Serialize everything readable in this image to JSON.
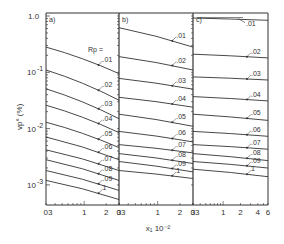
{
  "chart_data": {
    "type": "line",
    "title": "",
    "xlabel": "x1 10^-2",
    "ylabel": "vp° (%)",
    "yscale": "log",
    "xscale": "log",
    "ylim": [
      0.001,
      1.0
    ],
    "y_tick_labels": [
      "1.0",
      "10-1",
      "10-2",
      "10-3"
    ],
    "legend_title": "Rp =",
    "grid": false,
    "panels": [
      {
        "label": "a)",
        "xlim": [
          0.3,
          3
        ],
        "x_tick_labels": [
          "0.3",
          "1",
          "2",
          "3"
        ],
        "series": [
          {
            "name": ".01",
            "x": [
              0.3,
              3
            ],
            "values": [
              0.28,
              0.095
            ]
          },
          {
            "name": ".02",
            "x": [
              0.3,
              3
            ],
            "values": [
              0.11,
              0.032
            ]
          },
          {
            "name": ".03",
            "x": [
              0.3,
              3
            ],
            "values": [
              0.051,
              0.015
            ]
          },
          {
            "name": ".04",
            "x": [
              0.3,
              3
            ],
            "values": [
              0.026,
              0.0085
            ]
          },
          {
            "name": ".05",
            "x": [
              0.3,
              3
            ],
            "values": [
              0.013,
              0.0046
            ]
          },
          {
            "name": ".06",
            "x": [
              0.3,
              3
            ],
            "values": [
              0.0071,
              0.0028
            ]
          },
          {
            "name": ".07",
            "x": [
              0.3,
              3
            ],
            "values": [
              0.0042,
              0.0018
            ]
          },
          {
            "name": ".08",
            "x": [
              0.3,
              3
            ],
            "values": [
              0.0028,
              0.0012
            ]
          },
          {
            "name": ".09",
            "x": [
              0.3,
              3
            ],
            "values": [
              0.0018,
              0.0008
            ]
          },
          {
            "name": "1",
            "x": [
              0.3,
              3
            ],
            "values": [
              0.0012,
              0.00055
            ]
          }
        ]
      },
      {
        "label": "b)",
        "xlim": [
          0.3,
          3
        ],
        "x_tick_labels": [
          "0.3",
          "1",
          "2",
          "3"
        ],
        "series": [
          {
            "name": ".01",
            "x": [
              0.3,
              3
            ],
            "values": [
              0.62,
              0.28
            ]
          },
          {
            "name": ".02",
            "x": [
              0.3,
              3
            ],
            "values": [
              0.19,
              0.11
            ]
          },
          {
            "name": ".03",
            "x": [
              0.3,
              3
            ],
            "values": [
              0.078,
              0.05
            ]
          },
          {
            "name": ".04",
            "x": [
              0.3,
              3
            ],
            "values": [
              0.036,
              0.024
            ]
          },
          {
            "name": ".05",
            "x": [
              0.3,
              3
            ],
            "values": [
              0.018,
              0.011
            ]
          },
          {
            "name": ".06",
            "x": [
              0.3,
              3
            ],
            "values": [
              0.0089,
              0.0058
            ]
          },
          {
            "name": ".07",
            "x": [
              0.3,
              3
            ],
            "values": [
              0.0052,
              0.0037
            ]
          },
          {
            "name": ".08",
            "x": [
              0.3,
              3
            ],
            "values": [
              0.0036,
              0.0024
            ]
          },
          {
            "name": ".09",
            "x": [
              0.3,
              3
            ],
            "values": [
              0.0026,
              0.0017
            ]
          },
          {
            "name": "1",
            "x": [
              0.3,
              3
            ],
            "values": [
              0.0018,
              0.0013
            ]
          }
        ]
      },
      {
        "label": "c)",
        "xlim": [
          0.3,
          6
        ],
        "x_tick_labels": [
          "0.3",
          "1",
          "2",
          "4",
          "6"
        ],
        "series": [
          {
            "name": ".01",
            "x": [
              0.3,
              6
            ],
            "values": [
              0.92,
              0.84
            ]
          },
          {
            "name": ".02",
            "x": [
              0.3,
              6
            ],
            "values": [
              0.21,
              0.18
            ]
          },
          {
            "name": ".03",
            "x": [
              0.3,
              6
            ],
            "values": [
              0.083,
              0.073
            ]
          },
          {
            "name": ".04",
            "x": [
              0.3,
              6
            ],
            "values": [
              0.037,
              0.031
            ]
          },
          {
            "name": ".05",
            "x": [
              0.3,
              6
            ],
            "values": [
              0.018,
              0.014
            ]
          },
          {
            "name": ".06",
            "x": [
              0.3,
              6
            ],
            "values": [
              0.0089,
              0.0073
            ]
          },
          {
            "name": ".07",
            "x": [
              0.3,
              6
            ],
            "values": [
              0.0052,
              0.0043
            ]
          },
          {
            "name": ".08",
            "x": [
              0.3,
              6
            ],
            "values": [
              0.0036,
              0.0027
            ]
          },
          {
            "name": ".09",
            "x": [
              0.3,
              6
            ],
            "values": [
              0.0026,
              0.002
            ]
          },
          {
            "name": "1",
            "x": [
              0.3,
              6
            ],
            "values": [
              0.0019,
              0.0014
            ]
          }
        ]
      }
    ]
  },
  "labels": {
    "y_axis": "vp° (%)",
    "x_axis": "x₁ 10⁻²",
    "rp": "Rp ="
  }
}
